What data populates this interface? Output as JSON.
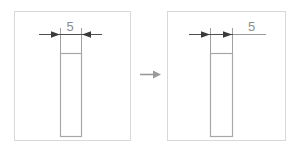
{
  "figure": {
    "type": "cad-dimension-reposition-illustration",
    "transition_icon": "right-arrow-icon",
    "colors": {
      "panel_border": "#d6d6d6",
      "part_outline": "#a8a8a8",
      "dimension_line": "#555555",
      "extension_line": "#9a9a9a",
      "text": "#8c8c8c",
      "transition_arrow": "#9a9a9a",
      "background": "#ffffff"
    }
  },
  "panels": [
    {
      "id": "before",
      "name": "before-panel",
      "frame": {
        "x": 14,
        "y": 11,
        "width": 116,
        "height": 129
      },
      "part": {
        "name": "rectangular-part",
        "x": 60,
        "y": 53,
        "width": 21,
        "height": 83
      },
      "dimension": {
        "name": "width-dimension",
        "value": "5",
        "label_x": 70,
        "label_y": 31,
        "label_anchor": "middle",
        "line_y": 34,
        "line_x1": 39,
        "line_x2": 102,
        "ext_left_x": 60,
        "ext_right_x": 81,
        "ext_top_y": 28,
        "ext_bottom_y": 53,
        "arrow_left_x": 60,
        "arrow_right_x": 81,
        "arrow_direction": "inward",
        "text_placement": "above-center",
        "leader": null
      }
    },
    {
      "id": "after",
      "name": "after-panel",
      "frame": {
        "x": 167,
        "y": 11,
        "width": 119,
        "height": 129
      },
      "part": {
        "name": "rectangular-part",
        "x": 210,
        "y": 53,
        "width": 22,
        "height": 83
      },
      "dimension": {
        "name": "width-dimension",
        "value": "5",
        "label_x": 248,
        "label_y": 31,
        "label_anchor": "start",
        "line_y": 34,
        "line_x1": 189,
        "line_x2": 232,
        "ext_left_x": 210,
        "ext_right_x": 232,
        "ext_top_y": 28,
        "ext_bottom_y": 53,
        "arrow_left_x": 210,
        "arrow_right_x": 232,
        "arrow_direction": "inward",
        "text_placement": "offset-right",
        "leader": {
          "x1": 232,
          "x2": 265,
          "y": 34
        }
      }
    }
  ],
  "transition": {
    "name": "transition-arrow",
    "x1": 140,
    "x2": 160,
    "y": 74
  }
}
